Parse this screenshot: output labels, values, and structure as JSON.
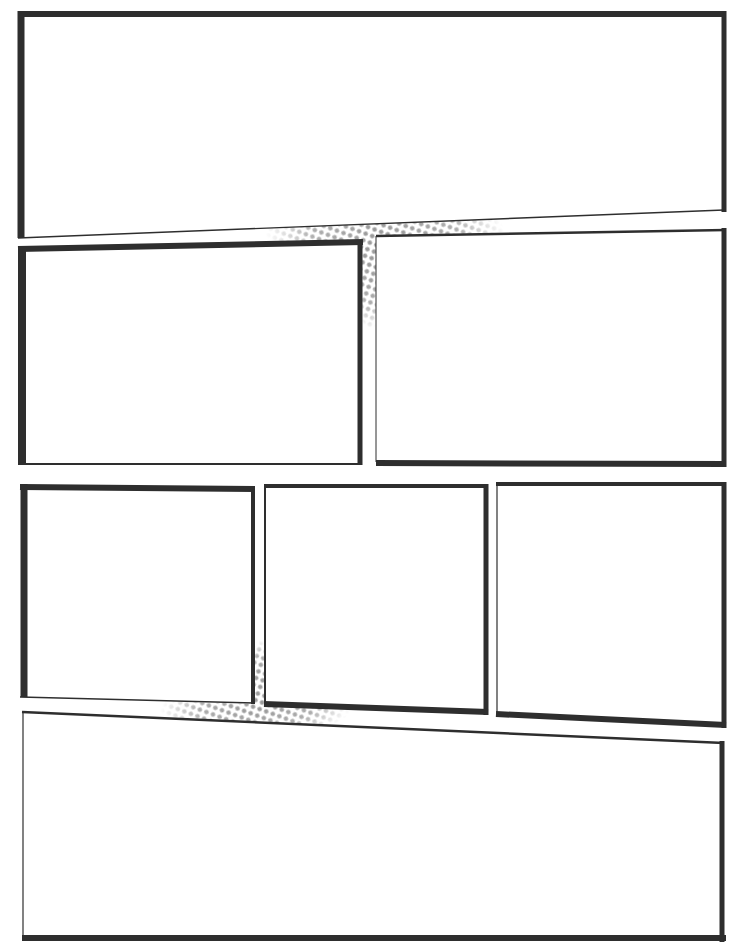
{
  "page": {
    "type": "comic-page-template",
    "background": "#ffffff",
    "header_text": "",
    "colors": {
      "border": "#2e2e2e",
      "halftone": "#9a9a9a",
      "panel_fill": "#ffffff"
    }
  },
  "panels": [
    {
      "id": 1,
      "label": "panel-1",
      "points": "18,14 724,14 724,210 18,238"
    },
    {
      "id": 2,
      "label": "panel-2",
      "points": "18,247 362,240 362,464 18,464"
    },
    {
      "id": 3,
      "label": "panel-3",
      "points": "376,236 726,228 726,466 376,462"
    },
    {
      "id": 4,
      "label": "panel-4",
      "points": "20,484 254,487 254,704 20,697"
    },
    {
      "id": 5,
      "label": "panel-5",
      "points": "264,484 488,484 488,714 264,702"
    },
    {
      "id": 6,
      "label": "panel-6",
      "points": "496,482 726,482 726,727 496,715"
    },
    {
      "id": 7,
      "label": "panel-7",
      "points": "22,712 724,742 724,940 22,940"
    }
  ],
  "halftones": [
    {
      "label": "gutter-halftone-upper",
      "cx": 385,
      "cy": 236
    },
    {
      "label": "gutter-halftone-lower",
      "cx": 258,
      "cy": 712
    }
  ]
}
